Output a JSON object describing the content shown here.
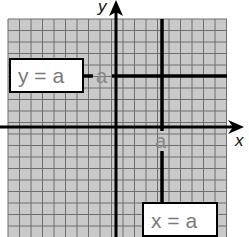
{
  "diagram": {
    "axes": {
      "x_label": "x",
      "y_label": "y"
    },
    "lines": [
      {
        "id": "horizontal",
        "equation_label": "y = a",
        "intercept_label": "a",
        "axis": "y"
      },
      {
        "id": "vertical",
        "equation_label": "x = a",
        "intercept_label": "a",
        "axis": "x"
      }
    ],
    "colors": {
      "grid_background": "#c9c9c9",
      "grid_minor": "#6e6e6e",
      "axis": "#000000",
      "label_text": "#7a7a7a",
      "box_fill": "#ffffff",
      "box_stroke": "#000000"
    }
  }
}
